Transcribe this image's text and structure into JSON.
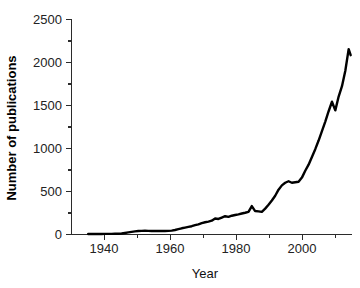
{
  "chart_data": {
    "type": "line",
    "title": "",
    "subtitle": "",
    "xlabel": "Year",
    "ylabel": "Number of publications",
    "xlim": [
      1931,
      2015
    ],
    "ylim": [
      0,
      2500
    ],
    "grid": false,
    "legend": null,
    "x_ticks": [
      1940,
      1960,
      1980,
      2000
    ],
    "x_tick_labels": [
      "1940",
      "1960",
      "1980",
      "2000"
    ],
    "x_minor_ticks": [
      1950,
      1970,
      1990,
      2010
    ],
    "y_ticks": [
      0,
      500,
      1000,
      1500,
      2000,
      2500
    ],
    "y_tick_labels": [
      "0",
      "500",
      "1000",
      "1500",
      "2000",
      "2500"
    ],
    "y_minor_ticks": [
      250,
      750,
      1250,
      1750,
      2250
    ],
    "series": [
      {
        "name": "Number of publications",
        "color": "#000000",
        "line_width": 2.4,
        "x": [
          1936,
          1937,
          1938,
          1939,
          1940,
          1941,
          1942,
          1943,
          1944,
          1945,
          1946,
          1947,
          1948,
          1949,
          1950,
          1951,
          1952,
          1953,
          1954,
          1955,
          1956,
          1957,
          1958,
          1959,
          1960,
          1961,
          1962,
          1963,
          1964,
          1965,
          1966,
          1967,
          1968,
          1969,
          1970,
          1971,
          1972,
          1973,
          1974,
          1975,
          1976,
          1977,
          1978,
          1979,
          1980,
          1981,
          1982,
          1983,
          1984,
          1985,
          1986,
          1987,
          1988,
          1989,
          1990,
          1991,
          1992,
          1993,
          1994,
          1995,
          1996,
          1997,
          1998,
          1999,
          2000,
          2001,
          2002,
          2003,
          2004,
          2005,
          2006,
          2007,
          2008,
          2009,
          2010,
          2011,
          2012,
          2013,
          2014
        ],
        "y": [
          5,
          5,
          6,
          6,
          6,
          7,
          7,
          7,
          8,
          9,
          12,
          18,
          24,
          30,
          36,
          40,
          42,
          44,
          42,
          40,
          42,
          41,
          40,
          40,
          42,
          45,
          52,
          62,
          72,
          80,
          88,
          96,
          108,
          118,
          132,
          142,
          150,
          160,
          185,
          180,
          196,
          212,
          204,
          218,
          226,
          234,
          244,
          252,
          262,
          330,
          272,
          268,
          262,
          300,
          345,
          395,
          450,
          520,
          570,
          600,
          618,
          600,
          606,
          612,
          660,
          740,
          810,
          900,
          990,
          1090,
          1200,
          1310,
          1430,
          1540,
          1440,
          1600,
          1720,
          1900,
          2150
        ],
        "last_point_y": 2080
      }
    ]
  },
  "figure": {
    "background_color": "#ffffff",
    "axis_color": "#2b2b2b",
    "text_color": "#111111"
  }
}
